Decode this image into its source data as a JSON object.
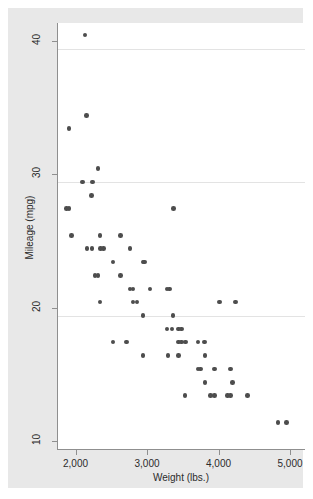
{
  "chart_data": {
    "type": "scatter",
    "title": "",
    "xlabel": "Weight (lbs.)",
    "ylabel": "Mileage (mpg)",
    "xlim": [
      1650,
      5100
    ],
    "ylim": [
      9.2,
      42.5
    ],
    "xticks": [
      2000,
      3000,
      4000,
      5000
    ],
    "xtick_labels": [
      "2,000",
      "3,000",
      "4,000",
      "5,000"
    ],
    "yticks": [
      10,
      20,
      30,
      40
    ],
    "ytick_labels": [
      "10",
      "20",
      "30",
      "40"
    ],
    "grid": "horizontal",
    "legend": "none",
    "marker_color": "#4d4d4d",
    "plot_background": "#ffffff",
    "graph_background": "#e8e8e8",
    "gridline_color": "#e3e3e3",
    "axis_color": "#8f8f8f",
    "points": [
      {
        "x": 2020,
        "y": 41
      },
      {
        "x": 2040,
        "y": 35
      },
      {
        "x": 1800,
        "y": 34
      },
      {
        "x": 2200,
        "y": 31
      },
      {
        "x": 1990,
        "y": 30
      },
      {
        "x": 2130,
        "y": 30
      },
      {
        "x": 2110,
        "y": 29
      },
      {
        "x": 1760,
        "y": 28
      },
      {
        "x": 1800,
        "y": 28
      },
      {
        "x": 3260,
        "y": 28
      },
      {
        "x": 1830,
        "y": 26
      },
      {
        "x": 2230,
        "y": 26
      },
      {
        "x": 2520,
        "y": 26
      },
      {
        "x": 2050,
        "y": 25
      },
      {
        "x": 2120,
        "y": 25
      },
      {
        "x": 2240,
        "y": 25
      },
      {
        "x": 2280,
        "y": 25
      },
      {
        "x": 2650,
        "y": 25
      },
      {
        "x": 2410,
        "y": 24
      },
      {
        "x": 2830,
        "y": 24
      },
      {
        "x": 2850,
        "y": 24
      },
      {
        "x": 2160,
        "y": 23
      },
      {
        "x": 2200,
        "y": 23
      },
      {
        "x": 2520,
        "y": 23
      },
      {
        "x": 2650,
        "y": 22
      },
      {
        "x": 2690,
        "y": 22
      },
      {
        "x": 2930,
        "y": 22
      },
      {
        "x": 3170,
        "y": 22
      },
      {
        "x": 3200,
        "y": 22
      },
      {
        "x": 2230,
        "y": 21
      },
      {
        "x": 2690,
        "y": 21
      },
      {
        "x": 2750,
        "y": 21
      },
      {
        "x": 3900,
        "y": 21
      },
      {
        "x": 4130,
        "y": 21
      },
      {
        "x": 2830,
        "y": 20
      },
      {
        "x": 3250,
        "y": 20
      },
      {
        "x": 3170,
        "y": 19
      },
      {
        "x": 3240,
        "y": 19
      },
      {
        "x": 3330,
        "y": 19
      },
      {
        "x": 3370,
        "y": 19
      },
      {
        "x": 2410,
        "y": 18
      },
      {
        "x": 2600,
        "y": 18
      },
      {
        "x": 3330,
        "y": 18
      },
      {
        "x": 3370,
        "y": 18
      },
      {
        "x": 3430,
        "y": 18
      },
      {
        "x": 3600,
        "y": 18
      },
      {
        "x": 3690,
        "y": 18
      },
      {
        "x": 2830,
        "y": 17
      },
      {
        "x": 3180,
        "y": 17
      },
      {
        "x": 3330,
        "y": 17
      },
      {
        "x": 3700,
        "y": 17
      },
      {
        "x": 3600,
        "y": 16
      },
      {
        "x": 3640,
        "y": 16
      },
      {
        "x": 3830,
        "y": 16
      },
      {
        "x": 4060,
        "y": 16
      },
      {
        "x": 3700,
        "y": 15
      },
      {
        "x": 4080,
        "y": 15
      },
      {
        "x": 3420,
        "y": 14
      },
      {
        "x": 3780,
        "y": 14
      },
      {
        "x": 3830,
        "y": 14
      },
      {
        "x": 4010,
        "y": 14
      },
      {
        "x": 4060,
        "y": 14
      },
      {
        "x": 4290,
        "y": 14
      },
      {
        "x": 4720,
        "y": 12
      },
      {
        "x": 4840,
        "y": 12
      }
    ]
  },
  "axes": {
    "y_title": "Mileage (mpg)",
    "x_title": "Weight (lbs.)"
  }
}
